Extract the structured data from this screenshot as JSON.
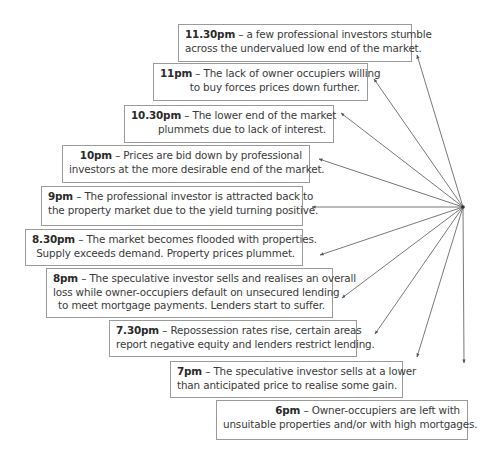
{
  "diagram": {
    "type": "radial-timeline",
    "origin": {
      "x": 463,
      "y": 207
    },
    "colors": {
      "text": "#3a3a3a",
      "border": "#9a9a9a",
      "arrow": "#555555"
    },
    "events": [
      {
        "time": "11.30pm",
        "sep": " – ",
        "lines": [
          "a few professional investors stumble",
          "across the undervalued low end of the market."
        ],
        "box": {
          "x": 178,
          "y": 24,
          "w": 234,
          "h": 38
        },
        "tip": {
          "x": 417,
          "y": 55
        }
      },
      {
        "time": "11pm",
        "sep": " – ",
        "lines": [
          "The lack of owner occupiers willing",
          "to buy forces prices down further."
        ],
        "box": {
          "x": 153,
          "y": 63,
          "w": 215,
          "h": 38
        },
        "tip": {
          "x": 374,
          "y": 79
        }
      },
      {
        "time": "10.30pm",
        "sep": " – ",
        "lines": [
          "The lower end of the market",
          "plummets due to lack of interest."
        ],
        "box": {
          "x": 124,
          "y": 105,
          "w": 210,
          "h": 38
        },
        "tip": {
          "x": 341,
          "y": 113
        }
      },
      {
        "time": "10pm",
        "sep": " – ",
        "lines": [
          "Prices are bid down by professional",
          "investors at the more desirable end of the market."
        ],
        "box": {
          "x": 62,
          "y": 145,
          "w": 248,
          "h": 38
        },
        "tip": {
          "x": 319,
          "y": 159
        }
      },
      {
        "time": "9pm",
        "sep": " – ",
        "lines": [
          "The professional investor is attracted back to",
          "the property market due to the yield turning positive."
        ],
        "box": {
          "x": 41,
          "y": 186,
          "w": 262,
          "h": 40
        },
        "tip": {
          "x": 312,
          "y": 207
        }
      },
      {
        "time": "8.30pm",
        "sep": " – ",
        "lines": [
          "The market becomes flooded with properties.",
          "Supply exceeds demand. Property prices plummet."
        ],
        "box": {
          "x": 25,
          "y": 229,
          "w": 278,
          "h": 37
        },
        "tip": {
          "x": 320,
          "y": 255
        }
      },
      {
        "time": "8pm",
        "sep": " – ",
        "lines": [
          "The speculative investor sells and realises an overall",
          "loss while owner-occupiers default on unsecured lending",
          "to meet mortgage payments.  Lenders start to suffer."
        ],
        "box": {
          "x": 46,
          "y": 268,
          "w": 287,
          "h": 50
        },
        "tip": {
          "x": 342,
          "y": 298
        }
      },
      {
        "time": "7.30pm",
        "sep": " – ",
        "lines": [
          "Repossession rates rise, certain areas",
          "report negative equity and lenders restrict lending."
        ],
        "box": {
          "x": 109,
          "y": 320,
          "w": 248,
          "h": 37
        },
        "tip": {
          "x": 375,
          "y": 334
        }
      },
      {
        "time": "7pm",
        "sep": " – ",
        "lines": [
          "The speculative investor sells at a lower",
          "than anticipated price to realise some gain."
        ],
        "box": {
          "x": 170,
          "y": 361,
          "w": 233,
          "h": 37
        },
        "tip": {
          "x": 417,
          "y": 357
        }
      },
      {
        "time": "6pm",
        "sep": " – ",
        "lines": [
          "Owner-occupiers are left with",
          "unsuitable properties and/or with high mortgages."
        ],
        "box": {
          "x": 216,
          "y": 400,
          "w": 252,
          "h": 40
        },
        "tip": {
          "x": 464,
          "y": 363
        }
      }
    ]
  }
}
